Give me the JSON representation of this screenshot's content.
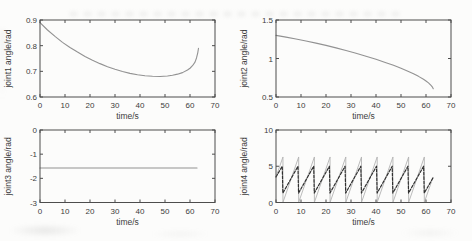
{
  "figure": {
    "background": "#fcfcfb",
    "axis_color": "#4d4d4d",
    "text_color": "#3d3d3d"
  },
  "chart_data": [
    {
      "id": "joint1",
      "type": "line",
      "title": "",
      "xlabel": "time/s",
      "ylabel": "joint1 angle/rad",
      "xlim": [
        0,
        70
      ],
      "ylim": [
        0.6,
        0.9
      ],
      "grid": false,
      "legend": null,
      "rect": [
        40,
        20,
        175,
        77
      ],
      "xticks": {
        "values": [
          0,
          10,
          20,
          30,
          40,
          50,
          60,
          70
        ],
        "labels": [
          "0",
          "10",
          "20",
          "30",
          "40",
          "50",
          "60",
          "70"
        ]
      },
      "yticks": {
        "values": [
          0.6,
          0.7,
          0.8,
          0.9
        ],
        "labels": [
          "0.6",
          "0.7",
          "0.8",
          "0.9"
        ]
      },
      "series": [
        {
          "name": "joint1-trajectory",
          "color": "#929292",
          "width": 1.1,
          "dash": null,
          "points": [
            [
              0,
              0.89
            ],
            [
              3,
              0.861
            ],
            [
              6,
              0.836
            ],
            [
              9,
              0.813
            ],
            [
              12,
              0.793
            ],
            [
              15,
              0.775
            ],
            [
              18,
              0.758
            ],
            [
              21,
              0.743
            ],
            [
              24,
              0.73
            ],
            [
              27,
              0.718
            ],
            [
              30,
              0.708
            ],
            [
              33,
              0.699
            ],
            [
              36,
              0.692
            ],
            [
              39,
              0.687
            ],
            [
              42,
              0.683
            ],
            [
              45,
              0.681
            ],
            [
              48,
              0.68
            ],
            [
              51,
              0.682
            ],
            [
              53,
              0.685
            ],
            [
              55,
              0.689
            ],
            [
              57,
              0.695
            ],
            [
              59,
              0.705
            ],
            [
              60,
              0.712
            ],
            [
              61,
              0.722
            ],
            [
              62,
              0.736
            ],
            [
              62.6,
              0.752
            ],
            [
              63.1,
              0.772
            ],
            [
              63.4,
              0.79
            ]
          ]
        }
      ]
    },
    {
      "id": "joint2",
      "type": "line",
      "title": "",
      "xlabel": "time/s",
      "ylabel": "joint2 angle/rad",
      "xlim": [
        0,
        70
      ],
      "ylim": [
        0.5,
        1.5
      ],
      "grid": false,
      "legend": null,
      "rect": [
        276,
        20,
        175,
        77
      ],
      "xticks": {
        "values": [
          0,
          10,
          20,
          30,
          40,
          50,
          60,
          70
        ],
        "labels": [
          "0",
          "10",
          "20",
          "30",
          "40",
          "50",
          "60",
          "70"
        ]
      },
      "yticks": {
        "values": [
          0.5,
          1,
          1.5
        ],
        "labels": [
          "0.5",
          "1",
          "1.5"
        ]
      },
      "series": [
        {
          "name": "joint2-trajectory",
          "color": "#929292",
          "width": 1.1,
          "dash": null,
          "points": [
            [
              0,
              1.3
            ],
            [
              4,
              1.278
            ],
            [
              8,
              1.253
            ],
            [
              12,
              1.228
            ],
            [
              16,
              1.2
            ],
            [
              20,
              1.17
            ],
            [
              24,
              1.138
            ],
            [
              28,
              1.104
            ],
            [
              32,
              1.068
            ],
            [
              36,
              1.03
            ],
            [
              40,
              0.99
            ],
            [
              44,
              0.946
            ],
            [
              47,
              0.912
            ],
            [
              50,
              0.874
            ],
            [
              53,
              0.832
            ],
            [
              55,
              0.802
            ],
            [
              57,
              0.768
            ],
            [
              59,
              0.73
            ],
            [
              60,
              0.708
            ],
            [
              61,
              0.683
            ],
            [
              62,
              0.652
            ],
            [
              62.5,
              0.632
            ],
            [
              62.9,
              0.607
            ]
          ]
        }
      ]
    },
    {
      "id": "joint3",
      "type": "line",
      "title": "",
      "xlabel": "time/s",
      "ylabel": "joint3 angle/rad",
      "xlim": [
        0,
        70
      ],
      "ylim": [
        -3,
        0
      ],
      "grid": false,
      "legend": null,
      "rect": [
        40,
        130,
        175,
        72.5
      ],
      "xticks": {
        "values": [
          0,
          10,
          20,
          30,
          40,
          50,
          60,
          70
        ],
        "labels": [
          "0",
          "10",
          "20",
          "30",
          "40",
          "50",
          "60",
          "70"
        ]
      },
      "yticks": {
        "values": [
          -3,
          -2,
          -1,
          0
        ],
        "labels": [
          "-3",
          "-2",
          "-1",
          "0"
        ]
      },
      "series": [
        {
          "name": "joint3-trajectory",
          "color": "#929292",
          "width": 1.1,
          "dash": null,
          "points": [
            [
              0,
              -1.57
            ],
            [
              62.8,
              -1.57
            ]
          ]
        }
      ]
    },
    {
      "id": "joint4",
      "type": "line",
      "title": "",
      "xlabel": "time/s",
      "ylabel": "joint4 angle/rad",
      "xlim": [
        0,
        70
      ],
      "ylim": [
        0,
        10
      ],
      "grid": false,
      "legend": null,
      "rect": [
        276,
        130,
        175,
        72.5
      ],
      "xticks": {
        "values": [
          0,
          10,
          20,
          30,
          40,
          50,
          60,
          70
        ],
        "labels": [
          "0",
          "10",
          "20",
          "30",
          "40",
          "50",
          "60",
          "70"
        ]
      },
      "yticks": {
        "values": [
          0,
          5,
          10
        ],
        "labels": [
          "0",
          "5",
          "10"
        ]
      },
      "series": [
        {
          "name": "joint4-reference-sawtooth",
          "color": "#b3b3b3",
          "width": 0.9,
          "dash": null,
          "points": [
            [
              0,
              3.5
            ],
            [
              2.78,
              6.28
            ],
            [
              2.78,
              0.02
            ],
            [
              9.07,
              6.28
            ],
            [
              9.07,
              0.02
            ],
            [
              15.35,
              6.28
            ],
            [
              15.35,
              0.02
            ],
            [
              21.63,
              6.28
            ],
            [
              21.63,
              0.02
            ],
            [
              27.92,
              6.28
            ],
            [
              27.92,
              0.02
            ],
            [
              34.2,
              6.28
            ],
            [
              34.2,
              0.02
            ],
            [
              40.48,
              6.28
            ],
            [
              40.48,
              0.02
            ],
            [
              46.77,
              6.28
            ],
            [
              46.77,
              0.02
            ],
            [
              53.05,
              6.28
            ],
            [
              53.05,
              0.02
            ],
            [
              59.33,
              6.28
            ],
            [
              59.33,
              0.02
            ],
            [
              62.8,
              3.47
            ]
          ]
        },
        {
          "name": "joint4-actual-sawtooth",
          "color": "#303030",
          "width": 1.2,
          "dash": "2.8,1.6",
          "points": [
            [
              0,
              3.53
            ],
            [
              2.5,
              5.0
            ],
            [
              2.75,
              1.3
            ],
            [
              8.78,
              5.0
            ],
            [
              9.03,
              1.3
            ],
            [
              15.07,
              5.0
            ],
            [
              15.32,
              1.3
            ],
            [
              21.35,
              5.0
            ],
            [
              21.6,
              1.3
            ],
            [
              27.63,
              5.0
            ],
            [
              27.88,
              1.3
            ],
            [
              33.92,
              5.0
            ],
            [
              34.17,
              1.3
            ],
            [
              40.2,
              5.0
            ],
            [
              40.45,
              1.3
            ],
            [
              46.48,
              5.0
            ],
            [
              46.73,
              1.3
            ],
            [
              52.77,
              5.0
            ],
            [
              53.02,
              1.3
            ],
            [
              59.05,
              5.0
            ],
            [
              59.3,
              1.3
            ],
            [
              62.8,
              3.4
            ]
          ]
        }
      ]
    }
  ]
}
